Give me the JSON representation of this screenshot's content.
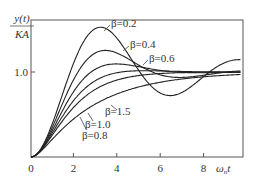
{
  "chart_data": {
    "type": "line",
    "title": "",
    "ylabel_top": "y(t)",
    "ylabel_bottom": "KA",
    "xlabel": "ωnt",
    "xlim": [
      0,
      9.7
    ],
    "ylim": [
      0,
      1.61
    ],
    "grid": false,
    "x_ticks": [
      {
        "value": 0,
        "label": "0"
      },
      {
        "value": 2,
        "label": "2"
      },
      {
        "value": 4,
        "label": "4"
      },
      {
        "value": 6,
        "label": "6"
      },
      {
        "value": 8,
        "label": "8"
      }
    ],
    "y_ticks": [
      {
        "value": 1.0,
        "label": "1.0"
      }
    ],
    "x": [
      0,
      0.5,
      1,
      1.5,
      2,
      2.5,
      3,
      3.5,
      4,
      4.5,
      5,
      5.5,
      6,
      6.5,
      7,
      7.5,
      8,
      8.5,
      9,
      9.5
    ],
    "series": [
      {
        "name": "β=0.2",
        "values": [
          0,
          0.12,
          0.43,
          0.83,
          1.2,
          1.45,
          1.53,
          1.46,
          1.27,
          1.04,
          0.84,
          0.72,
          0.69,
          0.75,
          0.87,
          1.01,
          1.13,
          1.2,
          1.21,
          1.16
        ]
      },
      {
        "name": "β=0.4",
        "values": [
          0,
          0.11,
          0.39,
          0.73,
          1.01,
          1.18,
          1.25,
          1.22,
          1.14,
          1.05,
          0.98,
          0.94,
          0.94,
          0.96,
          0.99,
          1.01,
          1.02,
          1.03,
          1.02,
          1.01
        ]
      },
      {
        "name": "β=0.6",
        "values": [
          0,
          0.1,
          0.35,
          0.64,
          0.88,
          1.02,
          1.08,
          1.09,
          1.07,
          1.04,
          1.02,
          1.0,
          0.99,
          0.99,
          1.0,
          1.0,
          1.0,
          1.0,
          1.0,
          1.0
        ]
      },
      {
        "name": "β=0.8",
        "values": [
          0,
          0.1,
          0.31,
          0.56,
          0.76,
          0.9,
          0.98,
          1.01,
          1.02,
          1.02,
          1.01,
          1.01,
          1.0,
          1.0,
          1.0,
          1.0,
          1.0,
          1.0,
          1.0,
          1.0
        ]
      },
      {
        "name": "β=1.0",
        "values": [
          0,
          0.09,
          0.26,
          0.44,
          0.59,
          0.71,
          0.8,
          0.86,
          0.91,
          0.94,
          0.96,
          0.97,
          0.98,
          0.99,
          0.99,
          1.0,
          1.0,
          1.0,
          1.0,
          1.0
        ]
      },
      {
        "name": "β=1.5",
        "values": [
          0,
          0.08,
          0.22,
          0.36,
          0.49,
          0.59,
          0.67,
          0.74,
          0.79,
          0.84,
          0.87,
          0.9,
          0.92,
          0.94,
          0.95,
          0.96,
          0.97,
          0.98,
          0.98,
          0.99
        ]
      }
    ],
    "annotations": [
      "β=0.2",
      "β=0.4",
      "β=0.6",
      "β=1.5",
      "β=1.0",
      "β=0.8"
    ]
  },
  "labels": {
    "y_num": "y(t)",
    "y_den": "KA",
    "xlabel_main": "ω",
    "xlabel_sub": "n",
    "xlabel_t": "t",
    "tick_0": "0",
    "tick_2": "2",
    "tick_4": "4",
    "tick_6": "6",
    "tick_8": "8",
    "tick_y1": "1.0",
    "beta02": "β=0.2",
    "beta04": "β=0.4",
    "beta06": "β=0.6",
    "beta15": "β=1.5",
    "beta10": "β=1.0",
    "beta08": "β=0.8"
  }
}
